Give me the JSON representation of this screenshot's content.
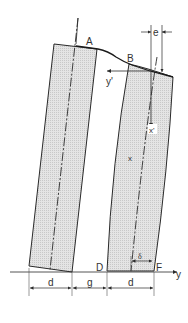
{
  "diagram": {
    "colors": {
      "line": "#2a2a2a",
      "hatch_fill": "#d9d9d9",
      "background": "#ffffff"
    },
    "points": {
      "A": "A",
      "B": "B",
      "D": "D",
      "F": "F"
    },
    "axes": {
      "y": "y",
      "y_prime": "y'",
      "x": "x",
      "x_prime": "x'"
    },
    "dimensions": {
      "e": "e",
      "delta": "δ",
      "d_left": "d",
      "g": "g",
      "d_right": "d"
    }
  }
}
